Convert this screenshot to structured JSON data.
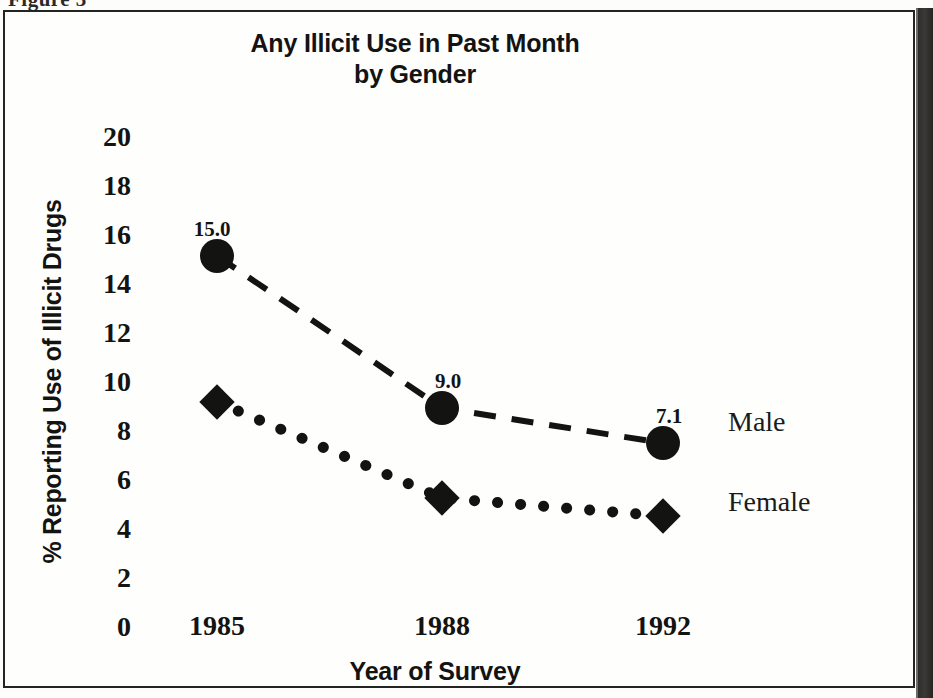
{
  "figure": {
    "caption": "Figure 3"
  },
  "chart": {
    "title_line1": "Any Illicit Use in Past Month",
    "title_line2": "by Gender",
    "y_axis_title": "% Reporting Use of Illicit Drugs",
    "x_axis_title": "Year of Survey"
  },
  "chart_data": {
    "type": "line",
    "title": "Any Illicit Use in Past Month by Gender",
    "xlabel": "Year of Survey",
    "ylabel": "% Reporting Use of Illicit Drugs",
    "categories": [
      "1985",
      "1988",
      "1992"
    ],
    "x_tick_labels": [
      "1985",
      "1988",
      "1992"
    ],
    "y_tick_labels": [
      "20",
      "18",
      "16",
      "14",
      "12",
      "10",
      "8",
      "6",
      "4",
      "2",
      "0"
    ],
    "y_ticks": [
      20,
      18,
      16,
      14,
      12,
      10,
      8,
      6,
      4,
      2,
      0
    ],
    "ylim": [
      0,
      20
    ],
    "grid": false,
    "legend_position": "right-of-line-ends",
    "series": [
      {
        "name": "Male",
        "marker": "filled-circle",
        "line_style": "dashed",
        "values": [
          15.0,
          9.0,
          7.1
        ],
        "point_labels": [
          "15.0",
          "9.0",
          "7.1"
        ]
      },
      {
        "name": "Female",
        "marker": "filled-diamond",
        "line_style": "dotted",
        "values": [
          9.2,
          5.3,
          4.6
        ],
        "point_labels": [
          "",
          "",
          ""
        ]
      }
    ]
  },
  "colors": {
    "ink": "#131312",
    "paper": "#fefefd",
    "frame": "#242422",
    "page_edge": "#2e2d2b"
  }
}
